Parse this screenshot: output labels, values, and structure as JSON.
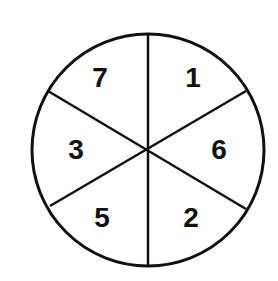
{
  "diagram": {
    "type": "spinner-wheel",
    "sectors": 6,
    "labels": {
      "top_left": "7",
      "top_right": "1",
      "left": "3",
      "right": "6",
      "bottom_left": "5",
      "bottom_right": "2"
    },
    "colors": {
      "stroke": "#111111",
      "fill": "#ffffff"
    }
  }
}
